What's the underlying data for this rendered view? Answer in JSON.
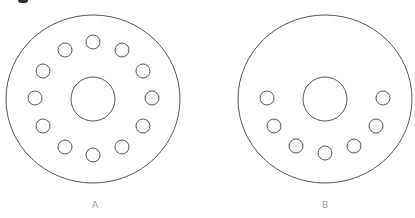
{
  "figure": {
    "stroke_color": "#555555",
    "label_color": "#9a9a9a",
    "discs": [
      {
        "label": "A",
        "center": [
          93,
          99
        ],
        "outer_radius": [
          87,
          84
        ],
        "center_hole_radius": 22,
        "hole_radius": 7,
        "hole_count": 12,
        "holes": [
          [
            93,
            42
          ],
          [
            122,
            50
          ],
          [
            143,
            71
          ],
          [
            152,
            98
          ],
          [
            143,
            126
          ],
          [
            122,
            147
          ],
          [
            93,
            155
          ],
          [
            65,
            147
          ],
          [
            43,
            126
          ],
          [
            35,
            98
          ],
          [
            43,
            71
          ],
          [
            65,
            50
          ]
        ]
      },
      {
        "label": "B",
        "center": [
          325,
          99
        ],
        "outer_radius": [
          87,
          84
        ],
        "center_hole_radius": 22,
        "hole_radius": 7,
        "hole_count": 7,
        "holes": [
          [
            267,
            98
          ],
          [
            274,
            126
          ],
          [
            296,
            146
          ],
          [
            325,
            153
          ],
          [
            354,
            146
          ],
          [
            376,
            126
          ],
          [
            383,
            98
          ]
        ]
      }
    ]
  }
}
